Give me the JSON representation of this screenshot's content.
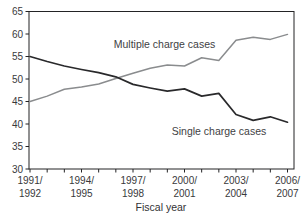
{
  "figure": {
    "xlabel": "Fiscal year",
    "annotations": {
      "multiple_label": "Multiple charge cases",
      "single_label": "Single charge cases"
    }
  },
  "colors": {
    "background": "#ffffff",
    "axis_frame": "#232325",
    "tick_text": "#39393b",
    "label_text": "#414143",
    "multiple_line": "#8a8c8e",
    "single_line": "#29292b"
  },
  "chart_data": {
    "type": "line",
    "title": "",
    "xlabel": "Fiscal year",
    "ylabel": "",
    "ylim": [
      30,
      65
    ],
    "yticks": [
      30,
      35,
      40,
      45,
      50,
      55,
      60,
      65
    ],
    "grid": false,
    "legend_position": "inline-annotations",
    "categories": [
      "1991/1992",
      "1992/1993",
      "1993/1994",
      "1994/1995",
      "1995/1996",
      "1996/1997",
      "1997/1998",
      "1998/1999",
      "1999/2000",
      "2000/2001",
      "2001/2002",
      "2002/2003",
      "2003/2004",
      "2004/2005",
      "2005/2006",
      "2006/2007"
    ],
    "xtick_labels": [
      [
        "1991/",
        "1992"
      ],
      [
        "1994/",
        "1995"
      ],
      [
        "1997/",
        "1998"
      ],
      [
        "2000/",
        "2001"
      ],
      [
        "2003/",
        "2004"
      ],
      [
        "2006/",
        "2007"
      ]
    ],
    "xtick_label_interval": 3,
    "series": [
      {
        "name": "Multiple charge cases",
        "color": "#8a8c8e",
        "values": [
          45.0,
          46.2,
          47.7,
          48.2,
          48.9,
          50.1,
          51.3,
          52.4,
          53.1,
          52.9,
          54.7,
          54.1,
          58.6,
          59.3,
          58.8,
          59.9
        ]
      },
      {
        "name": "Single charge cases",
        "color": "#29292b",
        "values": [
          55.0,
          53.9,
          52.9,
          52.1,
          51.4,
          50.5,
          48.8,
          48.0,
          47.3,
          47.8,
          46.2,
          46.8,
          42.1,
          40.8,
          41.6,
          40.4
        ]
      }
    ]
  }
}
